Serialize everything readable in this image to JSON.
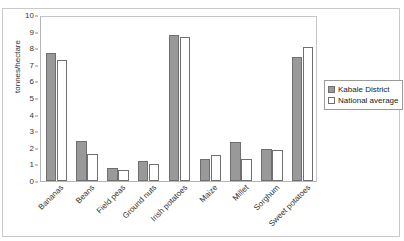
{
  "figure": {
    "title_faint": "",
    "y_axis_title": "tonnes/hectare"
  },
  "legend": {
    "position": "right",
    "items": [
      {
        "label": "Kabale District",
        "swatch": "filled-gray-swatch",
        "color": "#999999"
      },
      {
        "label": "National average",
        "swatch": "empty-white-swatch",
        "color": "#ffffff"
      }
    ]
  },
  "chart_data": {
    "type": "bar",
    "title": "",
    "xlabel": "",
    "ylabel": "tonnes/hectare",
    "ylim": [
      0,
      10
    ],
    "yticks": [
      0,
      1,
      2,
      3,
      4,
      5,
      6,
      7,
      8,
      9,
      10
    ],
    "grid": false,
    "legend_position": "right",
    "categories": [
      "Bananas",
      "Beans",
      "Field peas",
      "Ground nuts",
      "Irish potatoes",
      "Maize",
      "Millet",
      "Sorghum",
      "Sweet potatoes"
    ],
    "series": [
      {
        "name": "Kabale District",
        "color": "#999999",
        "values": [
          7.7,
          2.4,
          0.8,
          1.2,
          8.8,
          1.35,
          2.35,
          1.95,
          7.45
        ]
      },
      {
        "name": "National average",
        "color": "#ffffff",
        "values": [
          7.3,
          1.6,
          0.65,
          1.05,
          8.7,
          1.55,
          1.35,
          1.85,
          8.05
        ]
      }
    ]
  }
}
